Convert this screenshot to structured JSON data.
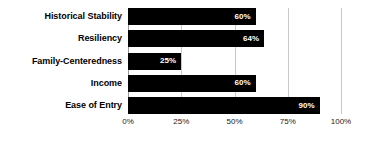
{
  "chart_data": {
    "type": "bar",
    "orientation": "horizontal",
    "title": "",
    "xlabel": "",
    "ylabel": "",
    "categories": [
      "Historical Stability",
      "Resiliency",
      "Family-Centeredness",
      "Income",
      "Ease of Entry"
    ],
    "values": [
      60,
      64,
      25,
      60,
      90
    ],
    "value_labels": [
      "60%",
      "64%",
      "25%",
      "60%",
      "90%"
    ],
    "xlim": [
      0,
      100
    ],
    "xticks": [
      0,
      25,
      50,
      75,
      100
    ],
    "xtick_labels": [
      "0%",
      "25%",
      "50%",
      "75%",
      "100%"
    ],
    "grid": true,
    "legend": false,
    "bar_color": "#000000",
    "value_label_color": "#ffffff",
    "gridline_color": "#c9c9c9",
    "background_color": "#ffffff"
  }
}
